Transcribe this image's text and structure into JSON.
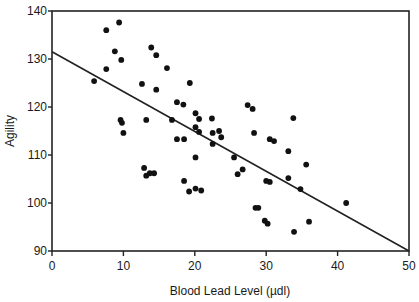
{
  "chart_data": {
    "type": "scatter",
    "title": "",
    "xlabel": "Blood Lead Level (µdl)",
    "ylabel": "Agility",
    "xlim": [
      0,
      50
    ],
    "ylim": [
      90,
      140
    ],
    "xticks": [
      0,
      10,
      20,
      30,
      40,
      50
    ],
    "yticks": [
      90,
      100,
      110,
      120,
      130,
      140
    ],
    "grid": false,
    "legend": null,
    "series": [
      {
        "name": "observations",
        "points": [
          [
            5.9,
            125.4
          ],
          [
            7.6,
            127.9
          ],
          [
            7.6,
            136.0
          ],
          [
            8.8,
            131.6
          ],
          [
            9.4,
            137.6
          ],
          [
            9.7,
            129.8
          ],
          [
            9.6,
            117.3
          ],
          [
            9.8,
            116.7
          ],
          [
            10.0,
            114.6
          ],
          [
            12.6,
            124.8
          ],
          [
            12.9,
            107.3
          ],
          [
            13.2,
            117.3
          ],
          [
            13.2,
            105.7
          ],
          [
            13.7,
            106.2
          ],
          [
            13.9,
            132.4
          ],
          [
            14.3,
            106.2
          ],
          [
            14.6,
            130.8
          ],
          [
            14.6,
            123.6
          ],
          [
            16.1,
            128.1
          ],
          [
            16.8,
            117.3
          ],
          [
            17.5,
            121.0
          ],
          [
            17.5,
            113.3
          ],
          [
            18.4,
            120.5
          ],
          [
            18.5,
            113.3
          ],
          [
            18.5,
            104.6
          ],
          [
            19.2,
            102.4
          ],
          [
            19.3,
            125.0
          ],
          [
            20.1,
            118.7
          ],
          [
            20.1,
            115.8
          ],
          [
            20.1,
            109.5
          ],
          [
            20.1,
            103.0
          ],
          [
            20.6,
            117.5
          ],
          [
            20.6,
            114.8
          ],
          [
            20.9,
            102.6
          ],
          [
            22.4,
            117.6
          ],
          [
            22.5,
            114.6
          ],
          [
            22.5,
            112.3
          ],
          [
            23.4,
            115.0
          ],
          [
            23.7,
            113.7
          ],
          [
            25.5,
            109.5
          ],
          [
            26.0,
            106.0
          ],
          [
            26.7,
            107.0
          ],
          [
            27.4,
            120.4
          ],
          [
            28.1,
            119.6
          ],
          [
            28.3,
            114.6
          ],
          [
            28.5,
            99.0
          ],
          [
            28.9,
            99.0
          ],
          [
            29.8,
            96.3
          ],
          [
            30.0,
            104.6
          ],
          [
            30.2,
            95.7
          ],
          [
            30.5,
            113.3
          ],
          [
            30.5,
            104.4
          ],
          [
            31.1,
            112.9
          ],
          [
            33.1,
            110.8
          ],
          [
            33.1,
            105.2
          ],
          [
            33.8,
            117.7
          ],
          [
            33.9,
            94.0
          ],
          [
            34.8,
            102.9
          ],
          [
            35.6,
            108.0
          ],
          [
            36.0,
            96.1
          ],
          [
            41.2,
            100.0
          ]
        ]
      }
    ],
    "regression_line": {
      "x": [
        0,
        50
      ],
      "y": [
        131.5,
        90
      ]
    },
    "colors": {
      "points": "#111111",
      "line": "#222222",
      "axis": "#222222"
    }
  }
}
